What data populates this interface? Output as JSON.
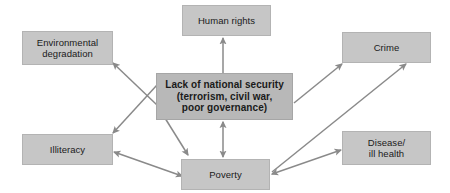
{
  "diagram": {
    "theme": {
      "box_fill": "#c6c6c6",
      "center_box_fill": "#b8b8b8",
      "arrow_color": "#8a8a8a",
      "text_color": "#1a1a1a",
      "background": "#ffffff"
    },
    "nodes": [
      {
        "id": "human_rights",
        "label": "Human rights",
        "x": 182,
        "y": 5,
        "w": 89,
        "h": 31,
        "emphasis": false
      },
      {
        "id": "environmental_degradation",
        "label": "Environmental degradation",
        "x": 22,
        "y": 31,
        "w": 91,
        "h": 34,
        "emphasis": false
      },
      {
        "id": "crime",
        "label": "Crime",
        "x": 342,
        "y": 32,
        "w": 89,
        "h": 31,
        "emphasis": false
      },
      {
        "id": "lack_of_national_security",
        "label": "Lack of national security (terrorism, civil war, poor governance)",
        "line1": "Lack of national security",
        "line2": "(terrorism, civil war,",
        "line3": "poor governance)",
        "x": 156,
        "y": 73,
        "w": 137,
        "h": 47,
        "emphasis": true
      },
      {
        "id": "illiteracy",
        "label": "Illiteracy",
        "x": 22,
        "y": 134,
        "w": 91,
        "h": 31,
        "emphasis": false
      },
      {
        "id": "disease_ill_health",
        "label": "Disease/ ill health",
        "line1": "Disease/",
        "line2": "ill health",
        "x": 342,
        "y": 131,
        "w": 89,
        "h": 34,
        "emphasis": false
      },
      {
        "id": "poverty",
        "label": "Poverty",
        "x": 181,
        "y": 159,
        "w": 89,
        "h": 31,
        "emphasis": false
      }
    ],
    "edges": [
      {
        "id": "security-to-human-rights",
        "from": "lack_of_national_security",
        "to": "human_rights",
        "heads": "single",
        "x1": 223,
        "y1": 73,
        "x2": 223,
        "y2": 38
      },
      {
        "id": "security-to-environmental-degradation",
        "from": "lack_of_national_security",
        "to": "environmental_degradation",
        "heads": "single",
        "x1": 157,
        "y1": 105,
        "x2": 113,
        "y2": 63
      },
      {
        "id": "security-to-illiteracy",
        "from": "lack_of_national_security",
        "to": "illiteracy",
        "heads": "single",
        "x1": 157,
        "y1": 85,
        "x2": 113,
        "y2": 133
      },
      {
        "id": "security-to-poverty-diagonal",
        "from": "lack_of_national_security",
        "to": "poverty",
        "heads": "single",
        "x1": 160,
        "y1": 110,
        "x2": 188,
        "y2": 155
      },
      {
        "id": "security-to-poverty-vertical",
        "from": "lack_of_national_security",
        "to": "poverty",
        "heads": "double",
        "x1": 223,
        "y1": 122,
        "x2": 223,
        "y2": 157
      },
      {
        "id": "security-to-crime",
        "from": "lack_of_national_security",
        "to": "crime",
        "heads": "single",
        "x1": 294,
        "y1": 103,
        "x2": 342,
        "y2": 64
      },
      {
        "id": "poverty-to-crime",
        "from": "poverty",
        "to": "crime",
        "heads": "single",
        "x1": 272,
        "y1": 172,
        "x2": 406,
        "y2": 64
      },
      {
        "id": "poverty-to-disease",
        "from": "poverty",
        "to": "disease_ill_health",
        "heads": "double",
        "x1": 272,
        "y1": 174,
        "x2": 341,
        "y2": 150
      },
      {
        "id": "poverty-to-illiteracy",
        "from": "poverty",
        "to": "illiteracy",
        "heads": "double",
        "x1": 182,
        "y1": 176,
        "x2": 114,
        "y2": 152
      }
    ]
  }
}
